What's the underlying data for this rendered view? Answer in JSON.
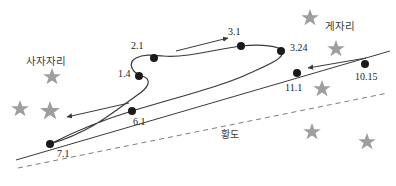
{
  "figure": {
    "kind": "astronomy-retrograde-motion-diagram",
    "background": "#ffffff",
    "size": {
      "width": 396,
      "height": 186
    },
    "stroke_color": "#3a3a3a",
    "star_color": "#9b9b9b",
    "dot_color": "#1a1a1a",
    "text_color": "#222222"
  },
  "constellations": [
    {
      "id": "leo",
      "label": "사자자리",
      "x": 26,
      "y": 53
    },
    {
      "id": "cancer",
      "label": "게자리",
      "x": 325,
      "y": 18
    }
  ],
  "ecliptic": {
    "label": "황도",
    "label_x": 221,
    "label_y": 126,
    "style": "dashed",
    "path": "M 18,168 L 388,93"
  },
  "path_labels": [
    {
      "id": "p1",
      "text": "1.4",
      "x": 118,
      "y": 68,
      "dot_x": 139,
      "dot_y": 76
    },
    {
      "id": "p2",
      "text": "2.1",
      "x": 131,
      "y": 40,
      "dot_x": 154,
      "dot_y": 58
    },
    {
      "id": "p3",
      "text": "3.1",
      "x": 228,
      "y": 26,
      "dot_x": 241,
      "dot_y": 46
    },
    {
      "id": "p4",
      "text": "3.24",
      "x": 290,
      "y": 42,
      "dot_x": 281,
      "dot_y": 51
    },
    {
      "id": "p5",
      "text": "11.1",
      "x": 285,
      "y": 82,
      "dot_x": 297,
      "dot_y": 73
    },
    {
      "id": "p6",
      "text": "10.15",
      "x": 358,
      "y": 71,
      "dot_x": 365,
      "dot_y": 64
    },
    {
      "id": "p7",
      "text": "6.1",
      "x": 133,
      "y": 116,
      "dot_x": 132,
      "dot_y": 111
    },
    {
      "id": "p8",
      "text": "7.1",
      "x": 57,
      "y": 148,
      "dot_x": 50,
      "dot_y": 144
    }
  ],
  "stars": [
    {
      "x": 52,
      "y": 76,
      "r": 8
    },
    {
      "x": 20,
      "y": 108,
      "r": 8
    },
    {
      "x": 50,
      "y": 110,
      "r": 9
    },
    {
      "x": 310,
      "y": 17,
      "r": 8
    },
    {
      "x": 336,
      "y": 48,
      "r": 8
    },
    {
      "x": 322,
      "y": 88,
      "r": 8
    },
    {
      "x": 312,
      "y": 131,
      "r": 8
    },
    {
      "x": 367,
      "y": 141,
      "r": 8
    }
  ],
  "motion_arrows": [
    {
      "id": "arrow-prograde-top",
      "from_x": 176,
      "from_y": 50,
      "to_x": 229,
      "to_y": 38,
      "direction": "right"
    },
    {
      "id": "arrow-retrograde-right",
      "from_x": 365,
      "from_y": 59,
      "to_x": 307,
      "to_y": 68,
      "direction": "left"
    },
    {
      "id": "arrow-prograde-lower-left",
      "from_x": 128,
      "from_y": 104,
      "to_x": 66,
      "to_y": 118,
      "direction": "left"
    }
  ],
  "tracks": {
    "apparent_path": "M 50,144 C 95,131 118,108 139,94 C 152,86 150,78 139,76 C 130,74 126,64 135,58 C 142,53 150,54 160,55 C 185,57 215,49 241,46 C 262,44 278,46 281,51 C 284,57 272,63 252,72 C 230,83 180,96 132,111 C 100,121 70,133 50,144",
    "direct_line": "M 18,160 L 388,52"
  }
}
